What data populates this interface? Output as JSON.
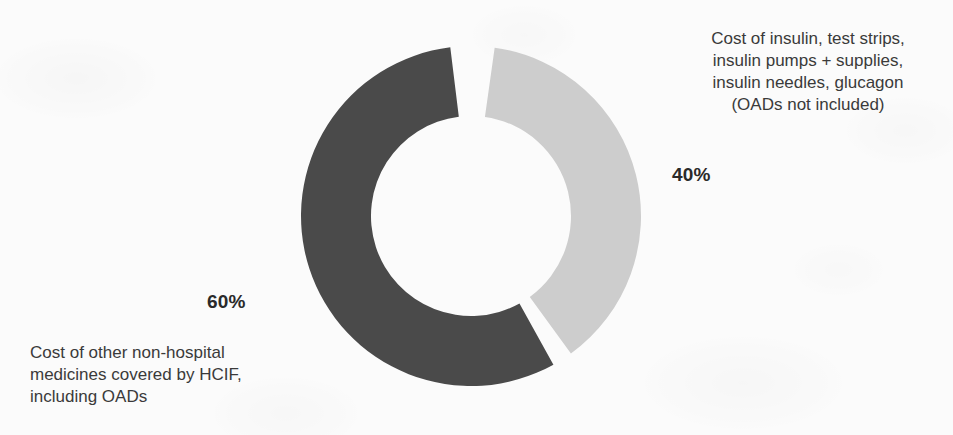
{
  "chart_data": {
    "type": "pie",
    "variant": "donut",
    "title": "",
    "subtitle": "",
    "xlabel": "",
    "ylabel": "",
    "grid": false,
    "legend_position": "annotations-outside",
    "units": "percent",
    "total": 100,
    "center": {
      "x": 471,
      "y": 216
    },
    "outer_radius": 170,
    "inner_radius": 100,
    "gap_degrees": 7,
    "categories": [
      "Cost of insulin, test strips, insulin pumps + supplies, insulin needles, glucagon (OADs not included)",
      "Cost of other non-hospital medicines covered by HCIF, including OADs"
    ],
    "values": [
      40,
      60
    ],
    "slices": [
      {
        "id": "insulin",
        "value": 40,
        "value_label": "40%",
        "color": "#cdcdcd",
        "start_angle": 8,
        "end_angle": 144,
        "description_lines": [
          "Cost of insulin, test strips,",
          "insulin pumps + supplies,",
          "insulin needles, glucagon",
          "(OADs not included)"
        ],
        "description": "Cost of insulin, test strips,\ninsulin pumps + supplies,\ninsulin needles, glucagon\n(OADs not included)"
      },
      {
        "id": "other-medicines",
        "value": 60,
        "value_label": "60%",
        "color": "#4a4a4a",
        "start_angle": 151,
        "end_angle": 353,
        "description_lines": [
          "Cost of other non-hospital",
          "medicines covered by HCIF,",
          "including OADs"
        ],
        "description": "Cost of other non-hospital\nmedicines covered by HCIF,\nincluding OADs"
      }
    ]
  },
  "colors": {
    "slice_dark": "#4a4a4a",
    "slice_light": "#cdcdcd",
    "background": "#fbfbfb",
    "text": "#3a3a3a",
    "value_text": "#2a2a2a"
  },
  "annotations": {
    "insulin_description": "Cost of insulin, test strips,\ninsulin pumps + supplies,\ninsulin needles, glucagon\n(OADs not included)",
    "insulin_value": "40%",
    "other_value": "60%",
    "other_description": "Cost of other non-hospital\nmedicines covered by HCIF,\nincluding OADs"
  }
}
